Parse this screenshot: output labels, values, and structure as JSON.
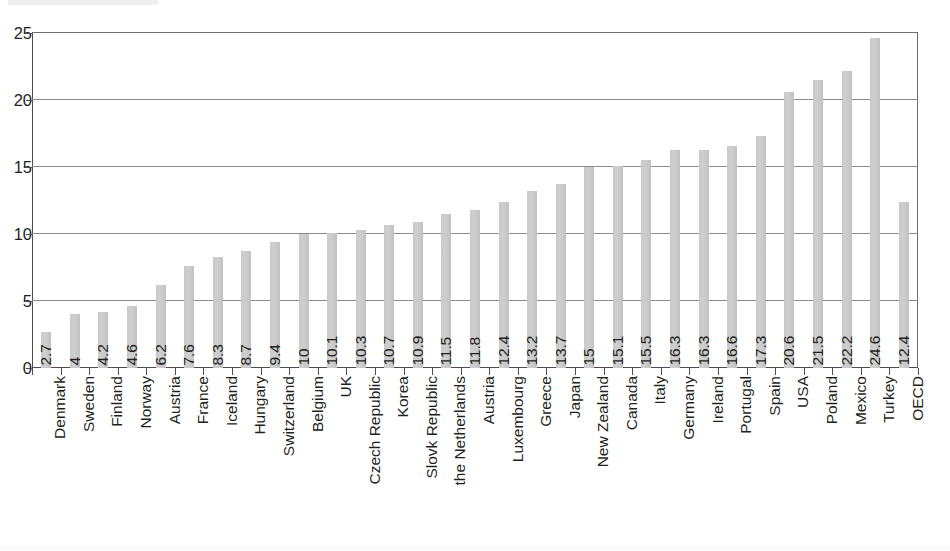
{
  "chart_data": {
    "type": "bar",
    "title": "",
    "subtitle": "",
    "xlabel": "",
    "ylabel": "",
    "ylim": [
      0,
      25
    ],
    "ytick_labels": [
      "0",
      "5",
      "10",
      "15",
      "20",
      "25"
    ],
    "ytick_values": [
      0,
      5,
      10,
      15,
      20,
      25
    ],
    "grid": true,
    "legend": "none",
    "bar_color": "#c9c9c9",
    "axis_color": "#4d4d4d",
    "gridline_color": "#8c8c8c",
    "text_color": "#231f20",
    "categories": [
      "Denmark",
      "Sweden",
      "Finland",
      "Norway",
      "Austria",
      "France",
      "Iceland",
      "Hungary",
      "Switzerland",
      "Belgium",
      "UK",
      "Czech Republic",
      "Korea",
      "Slovk Republic",
      "the Netherlands",
      "Austria",
      "Luxembourg",
      "Greece",
      "Japan",
      "New Zealand",
      "Canada",
      "Italy",
      "Germany",
      "Ireland",
      "Portugal",
      "Spain",
      "USA",
      "Poland",
      "Mexico",
      "Turkey",
      "OECD"
    ],
    "values": [
      2.7,
      4,
      4.2,
      4.6,
      6.2,
      7.6,
      8.3,
      8.7,
      9.4,
      10,
      10.1,
      10.3,
      10.7,
      10.9,
      11.5,
      11.8,
      12.4,
      13.2,
      13.7,
      15,
      15.1,
      15.5,
      16.3,
      16.3,
      16.6,
      17.3,
      20.6,
      21.5,
      22.2,
      24.6,
      12.4
    ],
    "value_labels": [
      "2.7",
      "4",
      "4.2",
      "4.6",
      "6.2",
      "7.6",
      "8.3",
      "8.7",
      "9.4",
      "10",
      "10.1",
      "10.3",
      "10.7",
      "10.9",
      "11.5",
      "11.8",
      "12.4",
      "13.2",
      "13.7",
      "15",
      "15.1",
      "15.5",
      "16.3",
      "16.3",
      "16.6",
      "17.3",
      "20.6",
      "21.5",
      "22.2",
      "24.6",
      "12.4"
    ]
  }
}
